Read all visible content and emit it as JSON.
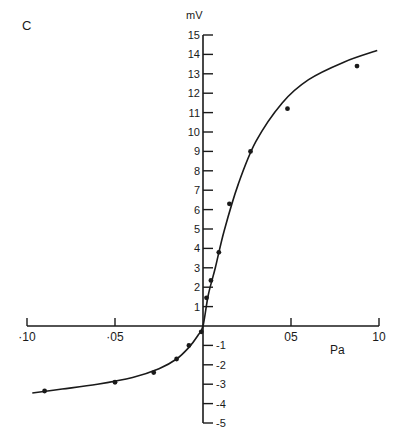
{
  "panel_label": "C",
  "chart_data": {
    "type": "scatter",
    "title": "",
    "panel": "C",
    "xlabel": "Pa",
    "ylabel": "mV",
    "xlim": [
      -1.0,
      1.0
    ],
    "ylim": [
      -5,
      15
    ],
    "grid": false,
    "legend": null,
    "x_ticks": [
      -1.0,
      -0.5,
      0.5,
      1.0
    ],
    "x_tick_labels": [
      "·10",
      "·05",
      "05",
      "10"
    ],
    "y_ticks": [
      -5,
      -4,
      -3,
      -2,
      -1,
      1,
      2,
      3,
      4,
      5,
      6,
      7,
      8,
      9,
      10,
      11,
      12,
      13,
      14,
      15
    ],
    "y_tick_labels": [
      "-5",
      "-4",
      "-3",
      "-2",
      "-1",
      "1",
      "2",
      "3",
      "4",
      "5",
      "6",
      "7",
      "8",
      "9",
      "10",
      "11",
      "12",
      "13",
      "14",
      "15"
    ],
    "series": [
      {
        "name": "measured",
        "kind": "points",
        "x": [
          -0.9,
          -0.5,
          -0.28,
          -0.15,
          -0.08,
          -0.01,
          0.02,
          0.045,
          0.09,
          0.15,
          0.27,
          0.48,
          0.875
        ],
        "y": [
          -3.35,
          -2.9,
          -2.4,
          -1.7,
          -1.0,
          -0.3,
          1.45,
          2.35,
          3.8,
          6.3,
          9.0,
          11.2,
          13.4
        ]
      },
      {
        "name": "fitted curve",
        "kind": "line",
        "x": [
          -0.97,
          -0.8,
          -0.6,
          -0.4,
          -0.25,
          -0.15,
          -0.08,
          -0.03,
          0.0,
          0.03,
          0.07,
          0.12,
          0.2,
          0.3,
          0.45,
          0.6,
          0.8,
          0.99
        ],
        "y": [
          -3.45,
          -3.25,
          -3.0,
          -2.65,
          -2.2,
          -1.7,
          -1.1,
          -0.5,
          0.0,
          1.6,
          3.0,
          4.9,
          7.3,
          9.5,
          11.5,
          12.7,
          13.6,
          14.2
        ]
      }
    ]
  }
}
